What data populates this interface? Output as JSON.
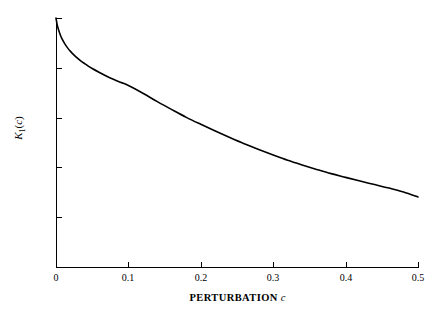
{
  "chart_data": {
    "type": "line",
    "title": "",
    "xlabel": "PERTURBATION c",
    "ylabel": "K1(c)",
    "xlim": [
      0,
      0.5
    ],
    "ylim": [
      0,
      1.0
    ],
    "grid": false,
    "legend": null,
    "line_color": "#000000",
    "background_color": "#ffffff",
    "xticks": [
      0,
      0.1,
      0.2,
      0.3,
      0.4,
      0.5
    ],
    "xtick_labels": [
      "0",
      "0.1",
      "0.2",
      "0.3",
      "0.4",
      "0.5"
    ],
    "yticks": [
      0,
      0.2,
      0.4,
      0.6,
      0.8,
      1.0
    ],
    "ytick_labels": [
      "0",
      "0.2",
      "0.4",
      "0.6",
      "0.8",
      "1.0"
    ],
    "series": [
      {
        "name": "K1(c)",
        "x": [
          0.0,
          0.002,
          0.005,
          0.008,
          0.012,
          0.016,
          0.02,
          0.025,
          0.03,
          0.035,
          0.04,
          0.045,
          0.05,
          0.06,
          0.07,
          0.08,
          0.09,
          0.1,
          0.12,
          0.14,
          0.16,
          0.18,
          0.2,
          0.22,
          0.24,
          0.26,
          0.28,
          0.3,
          0.32,
          0.34,
          0.36,
          0.38,
          0.4,
          0.42,
          0.44,
          0.46,
          0.48,
          0.5
        ],
        "y": [
          1.0,
          0.968,
          0.94,
          0.918,
          0.897,
          0.88,
          0.866,
          0.851,
          0.838,
          0.826,
          0.816,
          0.806,
          0.797,
          0.781,
          0.766,
          0.753,
          0.741,
          0.729,
          0.698,
          0.664,
          0.632,
          0.601,
          0.573,
          0.546,
          0.52,
          0.495,
          0.472,
          0.45,
          0.429,
          0.41,
          0.392,
          0.375,
          0.36,
          0.345,
          0.331,
          0.317,
          0.301,
          0.281
        ]
      }
    ]
  },
  "axes": {
    "x_title_main": "PERTURBATION",
    "x_title_var": "c",
    "y_title_letter": "K",
    "y_title_sub": "1",
    "y_title_open": "(",
    "y_title_var": "c",
    "y_title_close": ")"
  }
}
